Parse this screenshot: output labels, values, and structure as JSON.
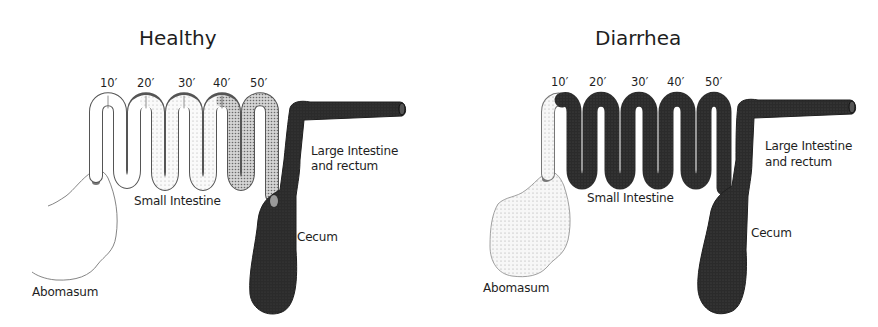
{
  "diagrams": [
    {
      "title": "Healthy",
      "distance_markers": [
        "10′",
        "20′",
        "30′",
        "40′",
        "50′"
      ],
      "labels": {
        "large_intestine": "Large Intestine",
        "large_intestine_2": "and rectum",
        "small_intestine": "Small Intestine",
        "cecum": "Cecum",
        "abomasum": "Abomasum"
      },
      "fill_states": {
        "abomasum": "empty",
        "small_intestine": "gradient: clear → light stipple → dense stipple toward 50′",
        "large_intestine": "dark"
      }
    },
    {
      "title": "Diarrhea",
      "distance_markers": [
        "10′",
        "20′",
        "30′",
        "40′",
        "50′"
      ],
      "labels": {
        "large_intestine": "Large Intestine",
        "large_intestine_2": "and rectum",
        "small_intestine": "Small Intestine",
        "cecum": "Cecum",
        "abomasum": "Abomasum"
      },
      "fill_states": {
        "abomasum": "light stipple",
        "small_intestine": "dark throughout after 10′",
        "large_intestine": "dark"
      }
    }
  ],
  "colors": {
    "background": "#ffffff",
    "outline": "#555555",
    "dark_fill": "#2b2b2b",
    "light_stipple": "#f2f2f2",
    "dense_stipple": "#b8b8b8",
    "text": "#1e1e1e"
  }
}
